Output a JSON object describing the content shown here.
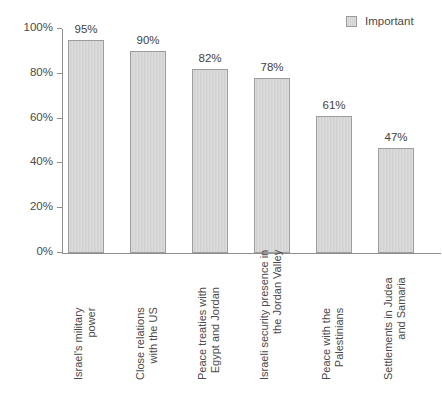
{
  "chart_data": {
    "type": "bar",
    "title": "",
    "subtitle": "",
    "xlabel": "",
    "ylabel": "",
    "ylim": [
      0,
      100
    ],
    "y_unit": "%",
    "grid": false,
    "legend_position": "top-right",
    "legend": [
      "Important"
    ],
    "categories": [
      "Israel's military power",
      "Close relations with the US",
      "Peace treaties with Egypt and Jordan",
      "Israeli security presence in the Jordan Valley",
      "Peace with the Palestinians",
      "Settlements in Judea and Samaria"
    ],
    "category_lines": [
      [
        "Israel's military",
        "power"
      ],
      [
        "Close relations",
        "with the US"
      ],
      [
        "Peace treaties with",
        "Egypt and Jordan"
      ],
      [
        "Israeli security presence in",
        "the Jordan Valley"
      ],
      [
        "Peace with the",
        "Palestinians"
      ],
      [
        "Settlements in Judea",
        "and Samaria"
      ]
    ],
    "values": [
      95,
      90,
      82,
      78,
      61,
      47
    ],
    "data_labels": [
      "95%",
      "90%",
      "82%",
      "78%",
      "61%",
      "47%"
    ],
    "series": [
      {
        "name": "Important",
        "values": [
          95,
          90,
          82,
          78,
          61,
          47
        ]
      }
    ],
    "y_ticks": [
      0,
      20,
      40,
      60,
      80,
      100
    ],
    "y_tick_labels": [
      "0%",
      "20%",
      "40%",
      "60%",
      "80%",
      "100%"
    ],
    "colors": {
      "bar_fill": "#d7d7d7",
      "bar_border": "#9d9d9d",
      "axis": "#8f8f8f",
      "text": "#4a4a4a",
      "background": "#ffffff"
    }
  },
  "legend": {
    "label": "Important"
  }
}
